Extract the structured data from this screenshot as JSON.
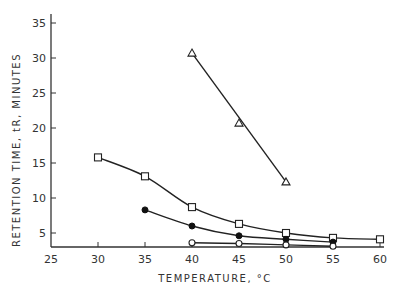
{
  "chart_data": {
    "type": "line",
    "title": "",
    "xlabel": "TEMPERATURE, °C",
    "ylabel": "RETENTION TIME, tR, MINUTES",
    "xlim": [
      25,
      60
    ],
    "ylim": [
      2,
      36
    ],
    "x_ticks": [
      25,
      30,
      35,
      40,
      45,
      50,
      55,
      60
    ],
    "y_ticks": [
      5,
      10,
      15,
      20,
      25,
      30,
      35
    ],
    "grid": false,
    "legend": "none",
    "series": [
      {
        "name": "triangles",
        "marker": "triangle-open",
        "x": [
          40,
          45,
          50
        ],
        "y": [
          30.7,
          20.7,
          12.3
        ],
        "fit": "straight"
      },
      {
        "name": "squares",
        "marker": "square-open",
        "x": [
          30,
          35,
          40,
          45,
          50,
          55,
          60
        ],
        "y": [
          15.8,
          13.1,
          8.7,
          6.3,
          5.0,
          4.3,
          4.1
        ],
        "fit": "smooth"
      },
      {
        "name": "filled circles",
        "marker": "circle-filled",
        "x": [
          35,
          40,
          45,
          50,
          55
        ],
        "y": [
          8.3,
          6.0,
          4.6,
          4.1,
          3.7
        ],
        "fit": "smooth"
      },
      {
        "name": "open circles",
        "marker": "circle-open",
        "x": [
          40,
          45,
          50,
          55
        ],
        "y": [
          3.6,
          3.5,
          3.3,
          3.1
        ],
        "fit": "smooth"
      }
    ]
  }
}
